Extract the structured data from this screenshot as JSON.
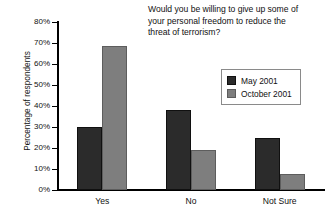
{
  "chart_data": {
    "type": "bar",
    "title": "Would you be willing to give up some of your personal freedom to reduce the threat of terrorism?",
    "xlabel": "",
    "ylabel": "Percentage of respondents",
    "categories": [
      "Yes",
      "No",
      "Not Sure"
    ],
    "series": [
      {
        "name": "May 2001",
        "values": [
          30,
          38,
          25
        ],
        "color": "#2b2b2b"
      },
      {
        "name": "October 2001",
        "values": [
          68.5,
          19,
          7.5
        ],
        "color": "#7e7e7e"
      }
    ],
    "ylim": [
      0,
      80
    ],
    "ytick_labels": [
      "0%",
      "10%",
      "20%",
      "30%",
      "40%",
      "50%",
      "60%",
      "70%",
      "80%"
    ],
    "ytick_values": [
      0,
      10,
      20,
      30,
      40,
      50,
      60,
      70,
      80
    ],
    "grid": false,
    "legend_position": "upper right"
  },
  "title": {
    "line1": "Would you be willing to give up some of",
    "line2": "your personal freedom to reduce the",
    "line3": "threat of terrorism?"
  }
}
